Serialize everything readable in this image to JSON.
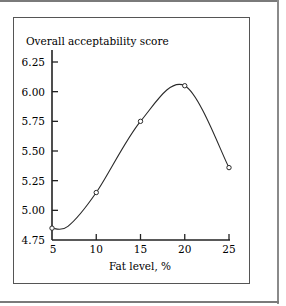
{
  "chart_data": {
    "type": "line",
    "title": "",
    "ylabel": "Overall acceptability score",
    "xlabel": "Fat level, %",
    "x": [
      5,
      10,
      15,
      20,
      25
    ],
    "series": [
      {
        "name": "Overall acceptability",
        "values": [
          4.85,
          5.15,
          5.75,
          6.05,
          5.36
        ]
      }
    ],
    "xticks": [
      "5",
      "10",
      "15",
      "20",
      "25"
    ],
    "yticks": [
      "4.75",
      "5.00",
      "5.25",
      "5.50",
      "5.75",
      "6.00",
      "6.25"
    ],
    "xlim": [
      5,
      25
    ],
    "ylim": [
      4.75,
      6.25
    ],
    "grid": false,
    "legend": "none",
    "markers": "open-circle",
    "smooth": true
  },
  "colors": {
    "line": "#2a2a2a",
    "axis": "#222222",
    "frame": "#7a7a7a"
  }
}
